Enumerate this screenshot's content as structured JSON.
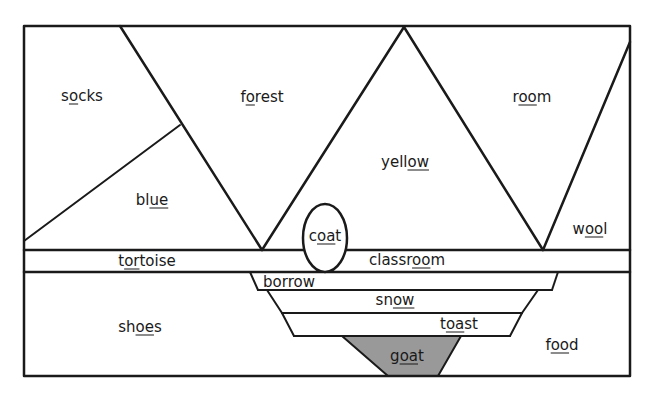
{
  "diagram": {
    "fill_color": "#999999",
    "line_color": "#1a1a1a",
    "words": [
      {
        "id": "socks",
        "parts": [
          "s",
          "o",
          "cks"
        ],
        "x": 82,
        "y": 96
      },
      {
        "id": "forest",
        "parts": [
          "f",
          "o",
          "rest"
        ],
        "x": 262,
        "y": 97
      },
      {
        "id": "room",
        "parts": [
          "r",
          "oo",
          "m"
        ],
        "x": 532,
        "y": 97
      },
      {
        "id": "yellow",
        "parts": [
          "yell",
          "ow",
          ""
        ],
        "x": 405,
        "y": 162
      },
      {
        "id": "blue",
        "parts": [
          "bl",
          "ue",
          ""
        ],
        "x": 152,
        "y": 200
      },
      {
        "id": "coat",
        "parts": [
          "c",
          "oa",
          "t"
        ],
        "x": 325,
        "y": 236
      },
      {
        "id": "wool",
        "parts": [
          "w",
          "oo",
          "l"
        ],
        "x": 590,
        "y": 229
      },
      {
        "id": "tortoise",
        "parts": [
          "t",
          "or",
          "toise"
        ],
        "x": 147,
        "y": 261
      },
      {
        "id": "classroom",
        "parts": [
          "classr",
          "oo",
          "m"
        ],
        "x": 407,
        "y": 260
      },
      {
        "id": "borrow",
        "parts": [
          "borr",
          "ow",
          ""
        ],
        "x": 289,
        "y": 282
      },
      {
        "id": "snow",
        "parts": [
          "sn",
          "ow",
          ""
        ],
        "x": 395,
        "y": 300
      },
      {
        "id": "shoes",
        "parts": [
          "sh",
          "oe",
          "s"
        ],
        "x": 140,
        "y": 327
      },
      {
        "id": "toast",
        "parts": [
          "t",
          "oa",
          "st"
        ],
        "x": 459,
        "y": 324
      },
      {
        "id": "food",
        "parts": [
          "f",
          "oo",
          "d"
        ],
        "x": 562,
        "y": 345
      },
      {
        "id": "goat",
        "parts": [
          "g",
          "oa",
          "t"
        ],
        "x": 407,
        "y": 356
      }
    ]
  }
}
